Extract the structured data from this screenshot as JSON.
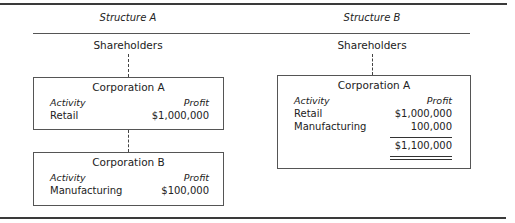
{
  "structures": [
    {
      "title": "Structure A",
      "top_entity": "Shareholders",
      "corporations": [
        {
          "name": "Corporation A",
          "headers": {
            "activity": "Activity",
            "profit": "Profit"
          },
          "rows": [
            {
              "activity": "Retail",
              "profit": "$1,000,000"
            }
          ]
        },
        {
          "name": "Corporation B",
          "headers": {
            "activity": "Activity",
            "profit": "Profit"
          },
          "rows": [
            {
              "activity": "Manufacturing",
              "profit": "$100,000"
            }
          ]
        }
      ]
    },
    {
      "title": "Structure B",
      "top_entity": "Shareholders",
      "corporations": [
        {
          "name": "Corporation A",
          "headers": {
            "activity": "Activity",
            "profit": "Profit"
          },
          "rows": [
            {
              "activity": "Retail",
              "profit": "$1,000,000"
            },
            {
              "activity": "Manufacturing",
              "profit": "100,000"
            }
          ],
          "total": "$1,100,000"
        }
      ]
    }
  ]
}
